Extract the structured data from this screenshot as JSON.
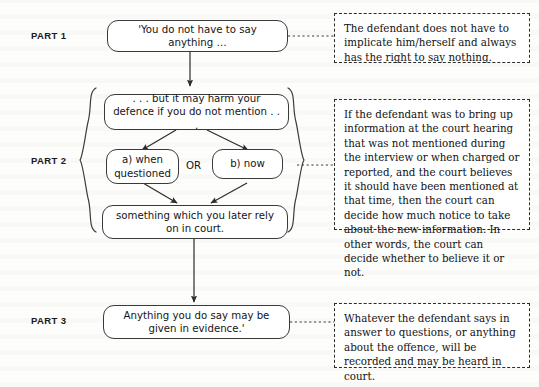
{
  "diagram": {
    "parts": [
      {
        "id": "part1",
        "label": "PART 1"
      },
      {
        "id": "part2",
        "label": "PART 2"
      },
      {
        "id": "part3",
        "label": "PART 3"
      }
    ],
    "nodes": [
      {
        "id": "node-caution-1",
        "part": "PART 1",
        "text": "'You do not have to say anything …"
      },
      {
        "id": "node-caution-2",
        "part": "PART 2",
        "text": ". . . but it may harm your defence if you do not mention . . ."
      },
      {
        "id": "node-branch-a",
        "part": "PART 2",
        "text": "a) when questioned"
      },
      {
        "id": "node-branch-b",
        "part": "PART 2",
        "text": "b) now"
      },
      {
        "id": "node-rely",
        "part": "PART 2",
        "text": "something which you later rely on in court."
      },
      {
        "id": "node-caution-3",
        "part": "PART 3",
        "text": "Anything you do say may be given in evidence.'"
      }
    ],
    "connector_label_or": "OR",
    "explanations": [
      {
        "id": "panel-part1",
        "for": "PART 1",
        "text": "The defendant does not have to implicate him/herself and always has the right to say nothing."
      },
      {
        "id": "panel-part2",
        "for": "PART 2",
        "text": "If the defendant was to bring up information at the court hearing that was not mentioned during the interview or when charged or reported, and the court believes it should have been mentioned at that time, then the court can decide how much notice to take about the new information. In other words, the court can decide whether to believe it or not."
      },
      {
        "id": "panel-part3",
        "for": "PART 3",
        "text": "Whatever the defendant says in answer to questions, or anything about the offence, will be recorded and may be heard in court."
      }
    ],
    "braces": {
      "left": "{",
      "right": "}"
    },
    "colors": {
      "ink": "#141414",
      "node_border": "#3a3a3a",
      "panel_border": "#2b2b2b",
      "page": "#fdfdfc"
    }
  }
}
